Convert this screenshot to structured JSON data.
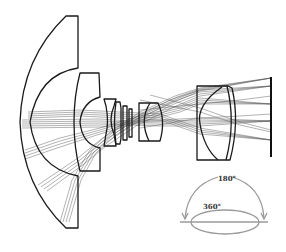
{
  "figure": {
    "type": "optical-layout",
    "elements": [
      {
        "id": "front-meniscus",
        "label": "front meniscus element"
      },
      {
        "id": "second-meniscus",
        "label": "second meniscus element"
      },
      {
        "id": "negative-element",
        "label": "small negative element"
      },
      {
        "id": "thin-plate",
        "label": "thin plate element"
      },
      {
        "id": "doublet-mid",
        "label": "middle positive element"
      },
      {
        "id": "rear-group",
        "label": "rear positive group"
      },
      {
        "id": "image-plane",
        "label": "image plane"
      }
    ],
    "colors": {
      "lens_stroke": "#1a1a1a",
      "ray_stroke": "#555555",
      "fov_stroke": "#9a9a9a",
      "background": "#ffffff"
    }
  },
  "fov_inset": {
    "vertical_label": "180°",
    "horizontal_label": "360°"
  }
}
